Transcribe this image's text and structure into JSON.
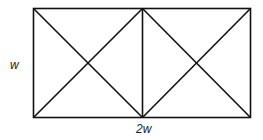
{
  "diagram": {
    "labels": {
      "height": "w",
      "width": "2w"
    },
    "colors": {
      "stroke": "#111111",
      "background": "#ffffff"
    }
  }
}
